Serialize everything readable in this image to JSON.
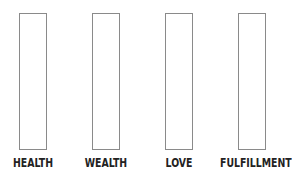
{
  "diagram": {
    "columns": [
      {
        "label": "HEALTH",
        "value": null
      },
      {
        "label": "WEALTH",
        "value": null
      },
      {
        "label": "LOVE",
        "value": null
      },
      {
        "label": "FULFILLMENT",
        "value": null
      }
    ],
    "colors": {
      "border": "#8a8a8a",
      "text": "#222222",
      "background": "#ffffff"
    }
  }
}
